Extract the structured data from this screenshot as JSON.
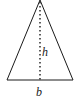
{
  "diagram": {
    "shape": "isosceles-triangle",
    "labels": {
      "height": "h",
      "base": "b"
    },
    "colors": {
      "stroke": "#1a1a1a",
      "background": "#ffffff"
    }
  }
}
